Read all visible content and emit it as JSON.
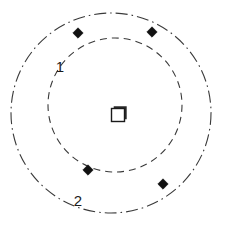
{
  "figure": {
    "title": "",
    "background_color": "#ffffff",
    "width": 239,
    "height": 228
  },
  "labels": {
    "ring_inner": "1",
    "ring_outer": "2"
  },
  "chart_data": {
    "type": "scatter",
    "title": "",
    "xlabel": "",
    "ylabel": "",
    "grid": false,
    "legend": "none",
    "xlim": [
      0,
      239
    ],
    "ylim": [
      0,
      228
    ],
    "center": {
      "name": "center-node",
      "shape": "square",
      "x": 118,
      "y": 115,
      "size": 13,
      "fill": "#ffffff",
      "stroke": "#1a1a1a"
    },
    "rings": [
      {
        "name": "inner-ring",
        "label": "1",
        "cx": 115,
        "cy": 105,
        "r": 67,
        "linestyle": "dashed",
        "color": "#3a3a3a",
        "linewidth": 1.1,
        "label_x": 60,
        "label_y": 68
      },
      {
        "name": "outer-ring",
        "label": "2",
        "cx": 111,
        "cy": 113,
        "r": 100,
        "linestyle": "dash-dot",
        "color": "#3a3a3a",
        "linewidth": 1.1,
        "label_x": 78,
        "label_y": 202
      }
    ],
    "markers": [
      {
        "name": "marker-top-left",
        "x": 78,
        "y": 33,
        "shape": "diamond",
        "size": 5.2,
        "color": "#111111"
      },
      {
        "name": "marker-top-right",
        "x": 152,
        "y": 32,
        "shape": "diamond",
        "size": 5.2,
        "color": "#111111"
      },
      {
        "name": "marker-bottom-left",
        "x": 88,
        "y": 170,
        "shape": "diamond",
        "size": 5.2,
        "color": "#111111"
      },
      {
        "name": "marker-bottom-right",
        "x": 163,
        "y": 184,
        "shape": "diamond",
        "size": 5.2,
        "color": "#111111"
      }
    ]
  }
}
